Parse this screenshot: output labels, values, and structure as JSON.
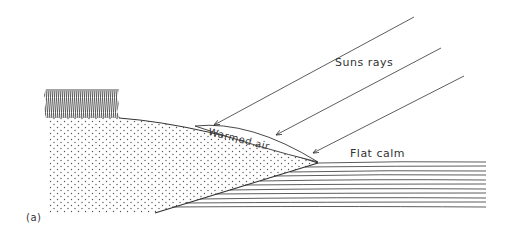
{
  "labels": {
    "suns_rays": "Suns rays",
    "warmed_air": "Warmed air",
    "flat_calm": "Flat calm",
    "panel": "(a)"
  },
  "colors": {
    "ink": "#333333",
    "background": "#ffffff"
  }
}
